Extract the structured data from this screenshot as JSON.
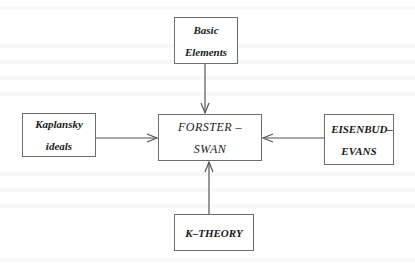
{
  "diagram": {
    "type": "flow",
    "central_node": {
      "id": "forster-swan",
      "lines": [
        "FORSTER –",
        "SWAN"
      ]
    },
    "nodes": [
      {
        "id": "basic-elements",
        "lines": [
          "Basic",
          "Elements"
        ],
        "position": "top"
      },
      {
        "id": "kaplansky-ideals",
        "lines": [
          "Kaplansky",
          "ideals"
        ],
        "position": "left"
      },
      {
        "id": "eisenbud-evans",
        "lines": [
          "EISENBUD–",
          "EVANS"
        ],
        "position": "right"
      },
      {
        "id": "k-theory",
        "lines": [
          "K–THEORY"
        ],
        "position": "bottom"
      }
    ],
    "edges": [
      {
        "from": "basic-elements",
        "to": "forster-swan"
      },
      {
        "from": "kaplansky-ideals",
        "to": "forster-swan"
      },
      {
        "from": "eisenbud-evans",
        "to": "forster-swan"
      },
      {
        "from": "k-theory",
        "to": "forster-swan"
      }
    ],
    "colors": {
      "border": "#6e6e6e",
      "text": "#1a1a1a",
      "arrow": "#555555",
      "background": "#ffffff"
    }
  }
}
